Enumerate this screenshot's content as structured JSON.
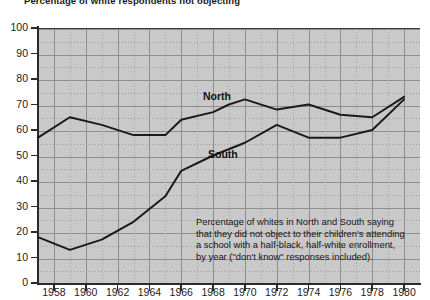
{
  "title": "Percentage of white respondents not objecting",
  "labels": {
    "north": "North",
    "south": "South"
  },
  "caption": {
    "line1": "Percentage of whites in North and South saying",
    "line2": "that they did not object to their children's attending",
    "line3": "a school with a half-black, half-white enrollment,",
    "line4": "by year (\"don't know\" responses included)."
  },
  "colors": {
    "plot_background": "#c9c9c9",
    "line": "#1a1a1a",
    "axis": "#2b2b2b",
    "gridline_major": "#8e8e8e",
    "gridline_minor": "#a5a5a5",
    "text": "#1b1b1b"
  },
  "chart_data": {
    "type": "line",
    "title": "Percentage of white respondents not objecting",
    "xlabel": "",
    "ylabel": "",
    "xlim": [
      1957,
      1981
    ],
    "ylim": [
      0,
      100
    ],
    "ytick_step": 10,
    "xtick_step": 2,
    "grid": true,
    "legend_position": "inline-annotation",
    "yticks": [
      0,
      10,
      20,
      30,
      40,
      50,
      60,
      70,
      80,
      90,
      100
    ],
    "xticks": [
      1958,
      1960,
      1962,
      1964,
      1966,
      1968,
      1970,
      1972,
      1974,
      1976,
      1978,
      1980
    ],
    "series": [
      {
        "name": "North",
        "x": [
          1957,
          1959,
          1961,
          1963,
          1965,
          1966,
          1968,
          1969,
          1970,
          1972,
          1974,
          1976,
          1978,
          1980
        ],
        "values": [
          57,
          65,
          62,
          58,
          58,
          64,
          67,
          70,
          72,
          68,
          70,
          66,
          65,
          73
        ]
      },
      {
        "name": "South",
        "x": [
          1957,
          1959,
          1961,
          1963,
          1965,
          1966,
          1968,
          1970,
          1972,
          1974,
          1976,
          1978,
          1980
        ],
        "values": [
          18,
          13,
          17,
          24,
          34,
          44,
          50,
          55,
          62,
          57,
          57,
          60,
          72
        ]
      }
    ]
  }
}
